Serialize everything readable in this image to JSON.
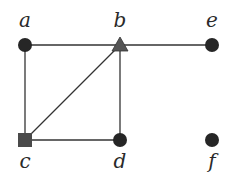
{
  "diagram": {
    "type": "graph",
    "nodes": [
      {
        "id": "a",
        "label": "a",
        "shape": "circle",
        "x": 25,
        "y": 45
      },
      {
        "id": "b",
        "label": "b",
        "shape": "triangle",
        "x": 120,
        "y": 45
      },
      {
        "id": "e",
        "label": "e",
        "shape": "circle",
        "x": 212,
        "y": 45
      },
      {
        "id": "c",
        "label": "c",
        "shape": "square",
        "x": 25,
        "y": 140
      },
      {
        "id": "d",
        "label": "d",
        "shape": "circle",
        "x": 120,
        "y": 140
      },
      {
        "id": "f",
        "label": "f",
        "shape": "circle",
        "x": 212,
        "y": 140
      }
    ],
    "edges": [
      [
        "a",
        "b"
      ],
      [
        "b",
        "e"
      ],
      [
        "a",
        "c"
      ],
      [
        "c",
        "b"
      ],
      [
        "b",
        "d"
      ],
      [
        "c",
        "d"
      ]
    ],
    "colors": {
      "circle": "#262626",
      "triangle": "#555555",
      "square": "#4a4a4a",
      "edge": "#333333"
    }
  }
}
